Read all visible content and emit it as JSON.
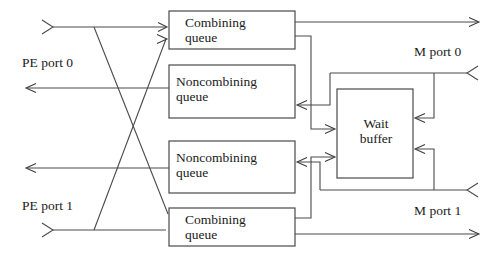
{
  "diagram": {
    "stroke_color": "#4a4a4a",
    "text_color": "#1a1a1a",
    "background": "#ffffff",
    "boxes": [
      {
        "id": "combining-queue-0",
        "label": "Combining\nqueue",
        "x": 169,
        "y": 11,
        "w": 126,
        "h": 38
      },
      {
        "id": "noncombining-queue-0",
        "label": "Noncombining\nqueue",
        "x": 169,
        "y": 65,
        "w": 126,
        "h": 53
      },
      {
        "id": "noncombining-queue-1",
        "label": "Noncombining\nqueue",
        "x": 169,
        "y": 141,
        "w": 126,
        "h": 52
      },
      {
        "id": "combining-queue-1",
        "label": "Combining\nqueue",
        "x": 169,
        "y": 208,
        "w": 126,
        "h": 38
      },
      {
        "id": "wait-buffer",
        "label": "Wait\nbuffer",
        "x": 337,
        "y": 89,
        "w": 76,
        "h": 89
      }
    ],
    "port_labels": [
      {
        "id": "pe-port-0",
        "text": "PE port 0",
        "x": 22,
        "y": 55
      },
      {
        "id": "pe-port-1",
        "text": "PE port 1",
        "x": 22,
        "y": 198
      },
      {
        "id": "m-port-0",
        "text": "M port 0",
        "x": 414,
        "y": 44
      },
      {
        "id": "m-port-1",
        "text": "M port 1",
        "x": 414,
        "y": 203
      }
    ]
  }
}
